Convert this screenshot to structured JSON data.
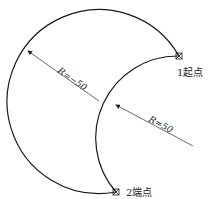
{
  "diagram": {
    "outer_arc": {
      "radius_label": "R=−50"
    },
    "inner_arc": {
      "radius_label": "R=50"
    },
    "start_point": {
      "label": "1起点"
    },
    "end_point": {
      "label": "2端点"
    },
    "colors": {
      "stroke": "#1a1a1a",
      "leader": "#444444",
      "background": "#ffffff"
    }
  }
}
